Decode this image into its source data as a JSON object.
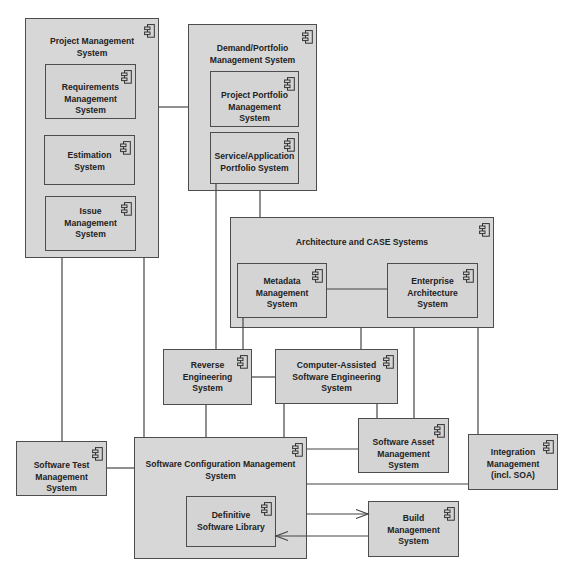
{
  "diagram": {
    "colors": {
      "fill": "#d4d4d4",
      "border": "#4d4d4d",
      "connector": "#454545",
      "text": "#222222"
    },
    "icon": "uml-component-icon",
    "components": {
      "project_management": "Project Management\nSystem",
      "requirements_management": "Requirements\nManagement\nSystem",
      "estimation": "Estimation\nSystem",
      "issue_management": "Issue\nManagement\nSystem",
      "demand_portfolio": "Demand/Portfolio\nManagement System",
      "project_portfolio": "Project Portfolio\nManagement\nSystem",
      "service_application_portfolio": "Service/Application\nPortfolio System",
      "architecture_case": "Architecture and CASE Systems",
      "metadata_management": "Metadata\nManagement\nSystem",
      "enterprise_architecture": "Enterprise\nArchitecture\nSystem",
      "reverse_engineering": "Reverse\nEngineering\nSystem",
      "case": "Computer-Assisted\nSoftware Engineering\nSystem",
      "software_asset_management": "Software Asset\nManagement\nSystem",
      "integration_management": "Integration\nManagement\n(incl. SOA)",
      "software_test_management": "Software Test\nManagement\nSystem",
      "software_configuration_management": "Software Configuration Management\nSystem",
      "definitive_software_library": "Definitive\nSoftware Library",
      "build_management": "Build\nManagement\nSystem"
    },
    "connections": [
      {
        "from": "Project Management System",
        "to": "Demand/Portfolio Management System",
        "type": "association"
      },
      {
        "from": "Project Management System",
        "to": "Software Test Management System",
        "type": "association"
      },
      {
        "from": "Project Management System",
        "to": "Software Configuration Management System",
        "type": "association"
      },
      {
        "from": "Demand/Portfolio Management System",
        "to": "Architecture and CASE Systems",
        "type": "association"
      },
      {
        "from": "Service/Application Portfolio System",
        "to": "Reverse Engineering System",
        "type": "association"
      },
      {
        "from": "Metadata Management System",
        "to": "Reverse Engineering System",
        "type": "association"
      },
      {
        "from": "Metadata Management System",
        "to": "Enterprise Architecture System",
        "type": "association"
      },
      {
        "from": "Architecture and CASE Systems",
        "to": "Computer-Assisted Software Engineering System",
        "type": "association"
      },
      {
        "from": "Architecture and CASE Systems",
        "to": "Software Asset Management System",
        "type": "association"
      },
      {
        "from": "Architecture and CASE Systems",
        "to": "Integration Management (incl. SOA)",
        "type": "association"
      },
      {
        "from": "Reverse Engineering System",
        "to": "Computer-Assisted Software Engineering System",
        "type": "association"
      },
      {
        "from": "Reverse Engineering System",
        "to": "Software Configuration Management System",
        "type": "association"
      },
      {
        "from": "Computer-Assisted Software Engineering System",
        "to": "Software Configuration Management System",
        "type": "association"
      },
      {
        "from": "Computer-Assisted Software Engineering System",
        "to": "Software Asset Management System",
        "type": "association"
      },
      {
        "from": "Software Test Management System",
        "to": "Software Configuration Management System",
        "type": "association"
      },
      {
        "from": "Software Configuration Management System",
        "to": "Software Asset Management System",
        "type": "association"
      },
      {
        "from": "Software Configuration Management System",
        "to": "Integration Management (incl. SOA)",
        "type": "association"
      },
      {
        "from": "Software Configuration Management System",
        "to": "Build Management System",
        "type": "directed"
      },
      {
        "from": "Build Management System",
        "to": "Definitive Software Library",
        "type": "directed"
      }
    ]
  }
}
